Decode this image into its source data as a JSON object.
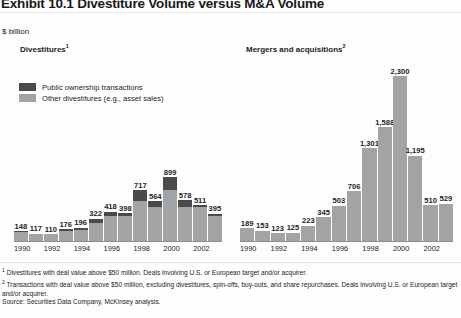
{
  "exhibit": {
    "title": "Exhibit 10.1 Divestiture Volume versus M&A Volume",
    "units": "$ billion"
  },
  "panels": {
    "left": {
      "heading": "Divestitures",
      "footnote_marker": "1"
    },
    "right": {
      "heading": "Mergers and acquisitions",
      "footnote_marker": "2"
    }
  },
  "legend": {
    "items": [
      {
        "label": "Public ownership transactions",
        "color": "#4a4a4a"
      },
      {
        "label": "Other divestitures (e.g., asset sales)",
        "color": "#a2a3a5"
      }
    ]
  },
  "footnotes": {
    "one": "Divestitures with deal value above $50 million.  Deals involving U.S. or European target and/or acquirer.",
    "two": "Transactions with deal value above $50 million, excluding divestitures, spin-offs, buy-outs, and share repurchases. Deals involving U.S. or European target and/or acquirer.",
    "source": "Source: Securities Data Company, McKinsey analysis."
  },
  "chart_data": [
    {
      "type": "bar",
      "title": "Divestitures",
      "subtype": "stacked",
      "xlabel": "",
      "ylabel": "$ billion",
      "ylim": [
        0,
        2300
      ],
      "grid": false,
      "legend_position": "top-left",
      "categories": [
        "1990",
        "1991",
        "1992",
        "1993",
        "1994",
        "1995",
        "1996",
        "1997",
        "1998",
        "1999",
        "2000",
        "2001",
        "2002",
        "2003"
      ],
      "tick_labels": [
        "1990",
        "",
        "1992",
        "",
        "1994",
        "",
        "1996",
        "",
        "1998",
        "",
        "2000",
        "",
        "2002",
        ""
      ],
      "data_labels": [
        "148",
        "117",
        "110",
        "176",
        "196",
        "322",
        "418",
        "398",
        "717",
        "564",
        "899",
        "578",
        "511",
        "395"
      ],
      "values": [
        148,
        117,
        110,
        176,
        196,
        322,
        418,
        398,
        717,
        564,
        899,
        578,
        511,
        395
      ],
      "series": [
        {
          "name": "Public ownership transactions",
          "color": "#4a4a4a",
          "values": [
            8,
            6,
            6,
            22,
            24,
            58,
            52,
            42,
            150,
            74,
            185,
            92,
            28,
            38
          ]
        },
        {
          "name": "Other divestitures (e.g., asset sales)",
          "color": "#a2a3a5",
          "values": [
            140,
            111,
            104,
            154,
            172,
            264,
            366,
            356,
            567,
            490,
            714,
            486,
            483,
            357
          ]
        }
      ]
    },
    {
      "type": "bar",
      "title": "Mergers and acquisitions",
      "subtype": "simple",
      "xlabel": "",
      "ylabel": "$ billion",
      "ylim": [
        0,
        2300
      ],
      "grid": false,
      "categories": [
        "1990",
        "1991",
        "1992",
        "1993",
        "1994",
        "1995",
        "1996",
        "1997",
        "1998",
        "1999",
        "2000",
        "2001",
        "2002",
        "2003"
      ],
      "tick_labels": [
        "1990",
        "",
        "1992",
        "",
        "1994",
        "",
        "1996",
        "",
        "1998",
        "",
        "2000",
        "",
        "2002",
        ""
      ],
      "data_labels": [
        "189",
        "153",
        "123",
        "125",
        "223",
        "345",
        "503",
        "706",
        "1,301",
        "1,588",
        "2,300",
        "1,195",
        "510",
        "529"
      ],
      "values": [
        189,
        153,
        123,
        125,
        223,
        345,
        503,
        706,
        1301,
        1588,
        2300,
        1195,
        510,
        529
      ],
      "series": [
        {
          "name": "Mergers and acquisitions",
          "color": "#a2a3a5",
          "values": [
            189,
            153,
            123,
            125,
            223,
            345,
            503,
            706,
            1301,
            1588,
            2300,
            1195,
            510,
            529
          ]
        }
      ]
    }
  ]
}
